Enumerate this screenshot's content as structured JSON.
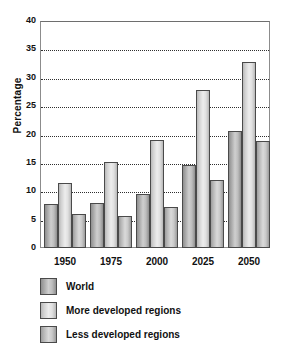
{
  "chart_data": {
    "type": "bar",
    "title": "",
    "xlabel": "",
    "ylabel": "Percentage",
    "ylim": [
      0,
      40
    ],
    "ytick_step": 5,
    "yticks": [
      40,
      35,
      30,
      25,
      20,
      15,
      10,
      5,
      0
    ],
    "grid": true,
    "grid_axis": "y",
    "legend_position": "bottom-left",
    "categories": [
      "1950",
      "1975",
      "2000",
      "2025",
      "2050"
    ],
    "series": [
      {
        "name": "World",
        "color": "#bdbdbd",
        "values": [
          7.7,
          8.0,
          9.6,
          14.6,
          20.6
        ]
      },
      {
        "name": "More developed regions",
        "color": "#e0e0e0",
        "values": [
          11.4,
          15.1,
          19.0,
          27.8,
          32.8
        ]
      },
      {
        "name": "Less developed regions",
        "color": "#c9c9c9",
        "values": [
          6.0,
          5.7,
          7.2,
          12.0,
          18.9
        ]
      }
    ]
  },
  "axis": {
    "y_title": "Percentage"
  },
  "colors": {
    "frame": "#8c8c8c",
    "gridline": "#2f2f2f",
    "bar_border": "#4a4a4a",
    "text": "#111111",
    "background": "#ffffff"
  }
}
